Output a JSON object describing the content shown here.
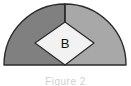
{
  "figure": {
    "type": "geometry-diagram",
    "background_color": "#ffffff",
    "shape_name": "quarter-sector-with-inscribed-square",
    "region_label": "B",
    "caption": "Figure 2",
    "outline_color": "#2b2b2b",
    "sectors": [
      {
        "name": "left-sector-half",
        "fill_color": "#808080"
      },
      {
        "name": "right-sector-half",
        "fill_color": "#a8a8a8"
      }
    ],
    "inscribed_square": {
      "name": "inscribed-square-B",
      "fill_color": "#f2f2f2",
      "label": "B"
    }
  }
}
